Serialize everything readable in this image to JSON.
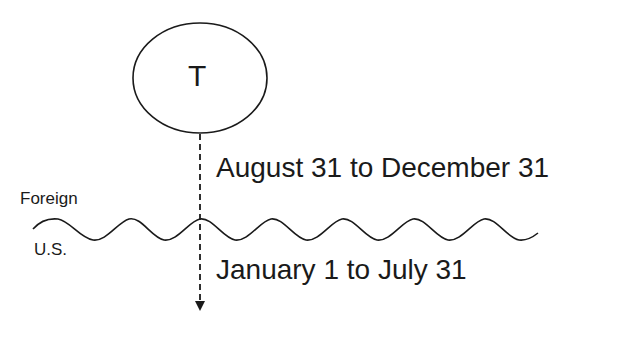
{
  "diagram": {
    "node": {
      "label": "T",
      "shape": "ellipse"
    },
    "periods": [
      {
        "label": "August 31 to December 31",
        "side": "above-border"
      },
      {
        "label": "January 1 to July 31",
        "side": "below-border"
      }
    ],
    "border": {
      "label_above": "Foreign",
      "label_below": "U.S.",
      "style": "wavy-line"
    },
    "arrow": {
      "style": "dashed",
      "direction": "down"
    },
    "colors": {
      "stroke": "#1a1a1a",
      "background": "#ffffff"
    }
  }
}
